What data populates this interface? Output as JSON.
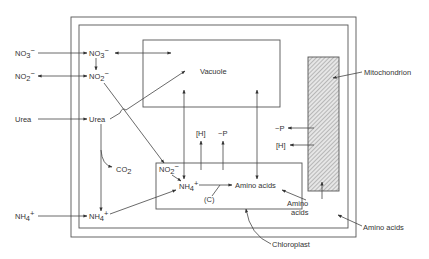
{
  "diagram": {
    "colors": {
      "line": "#444444",
      "box": "#555555",
      "text": "#333333",
      "hatch": "#888888"
    },
    "compartments": {
      "vacuole": "Vacuole",
      "mitochondrion": "Mitochondrion",
      "chloroplast": "Chloroplast"
    },
    "external": {
      "nitrate": "NO",
      "nitrate_sub": "3",
      "nitrate_sup": "−",
      "nitrite": "NO",
      "nitrite_sub": "2",
      "nitrite_sup": "−",
      "urea": "Urea",
      "ammonium": "NH",
      "ammonium_sub": "4",
      "ammonium_sup": "+",
      "amino_acids": "Amino acids"
    },
    "cytosol": {
      "nitrate": "NO",
      "nitrate_sub": "3",
      "nitrate_sup": "−",
      "nitrite": "NO",
      "nitrite_sub": "2",
      "nitrite_sup": "−",
      "urea": "Urea",
      "co2": "CO",
      "co2_sub": "2",
      "ammonium": "NH",
      "ammonium_sub": "4",
      "ammonium_sup": "+",
      "amino_acids_line1": "Amino",
      "amino_acids_line2": "acids",
      "h_chloro": "[H]",
      "p_chloro": "~P",
      "p_mito": "~P",
      "h_mito": "[H]"
    },
    "chloroplast_contents": {
      "nitrite": "NO",
      "nitrite_sub": "2",
      "nitrite_sup": "−",
      "ammonium": "NH",
      "ammonium_sub": "4",
      "ammonium_sup": "+",
      "carbon": "(C)",
      "amino_acids": "Amino acids"
    }
  }
}
